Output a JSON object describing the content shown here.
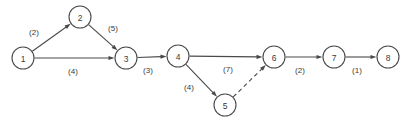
{
  "diagram": {
    "type": "directed-network-graph",
    "title": "",
    "background_color": "#ffffff",
    "stroke_color": "#4a4a4a",
    "text_color": "#3a3a3a",
    "node_radius": 11,
    "nodes": [
      {
        "id": "1",
        "label": "1",
        "x": 23,
        "y": 58
      },
      {
        "id": "2",
        "label": "2",
        "x": 80,
        "y": 17
      },
      {
        "id": "3",
        "label": "3",
        "x": 126,
        "y": 58
      },
      {
        "id": "4",
        "label": "4",
        "x": 178,
        "y": 56
      },
      {
        "id": "5",
        "label": "5",
        "x": 225,
        "y": 105
      },
      {
        "id": "6",
        "label": "6",
        "x": 274,
        "y": 57
      },
      {
        "id": "7",
        "label": "7",
        "x": 334,
        "y": 57
      },
      {
        "id": "8",
        "label": "8",
        "x": 388,
        "y": 57
      }
    ],
    "edges": [
      {
        "from": "1",
        "to": "2",
        "weight": "2",
        "label": "(2)",
        "label_x": 34,
        "label_y": 32,
        "style": "solid",
        "arrow": true
      },
      {
        "from": "2",
        "to": "3",
        "weight": "5",
        "label": "(5)",
        "label_x": 113,
        "label_y": 28,
        "style": "solid",
        "arrow": true
      },
      {
        "from": "1",
        "to": "3",
        "weight": "4",
        "label": "(4)",
        "label_x": 73,
        "label_y": 71,
        "style": "solid",
        "arrow": true
      },
      {
        "from": "3",
        "to": "4",
        "weight": "3",
        "label": "(3)",
        "label_x": 148,
        "label_y": 70,
        "style": "solid",
        "arrow": true
      },
      {
        "from": "4",
        "to": "6",
        "weight": "7",
        "label": "(7)",
        "label_x": 228,
        "label_y": 69,
        "style": "solid",
        "arrow": true
      },
      {
        "from": "4",
        "to": "5",
        "weight": "4",
        "label": "(4)",
        "label_x": 189,
        "label_y": 87,
        "style": "solid",
        "arrow": true
      },
      {
        "from": "5",
        "to": "6",
        "weight": "",
        "label": "",
        "label_x": 0,
        "label_y": 0,
        "style": "dashed",
        "arrow": true
      },
      {
        "from": "6",
        "to": "7",
        "weight": "2",
        "label": "(2)",
        "label_x": 300,
        "label_y": 70,
        "style": "solid",
        "arrow": true
      },
      {
        "from": "7",
        "to": "8",
        "weight": "1",
        "label": "(1)",
        "label_x": 357,
        "label_y": 70,
        "style": "solid",
        "arrow": true
      }
    ]
  }
}
